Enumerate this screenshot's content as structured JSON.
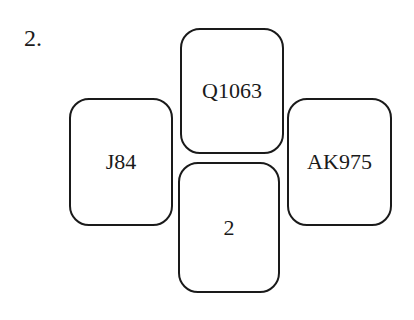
{
  "problem": {
    "number_label": "2."
  },
  "cards": {
    "left": {
      "label": "J84"
    },
    "top": {
      "label": "Q1063"
    },
    "bottom": {
      "label": "2"
    },
    "right": {
      "label": "AK975"
    }
  },
  "colors": {
    "stroke": "#1a1a1a",
    "background": "#ffffff"
  }
}
